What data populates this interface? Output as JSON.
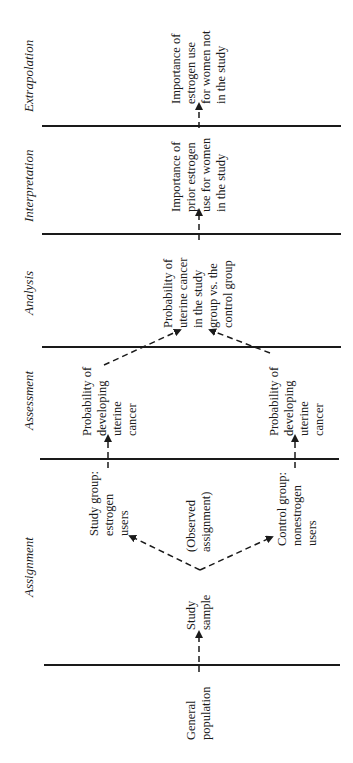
{
  "stages": [
    {
      "label": "Extrapolation"
    },
    {
      "label": "Interpretation"
    },
    {
      "label": "Analysis"
    },
    {
      "label": "Assessment"
    },
    {
      "label": "Assignment"
    }
  ],
  "nodes": {
    "general_population": "General\npopulation",
    "study_sample": "Study\nsample",
    "observed_assignment": "(Observed\nassignment)",
    "study_group": "Study group:\nestrogen\nusers",
    "control_group": "Control group:\nnonestrogen\nusers",
    "study_probability": "Probability of\ndeveloping\nuterine\ncancer",
    "control_probability": "Probability of\ndeveloping\nuterine\ncancer",
    "analysis": "Probability of\nuterine cancer\nin the study\ngroup vs. the\ncontrol group",
    "interpretation": "Importance of\nprior estrogen\nuse for women\nin the study",
    "extrapolation": "Importance of\nestrogen use\nfor women not\nin the study"
  },
  "colors": {
    "ink": "#1a1a1a",
    "background": "#ffffff"
  }
}
